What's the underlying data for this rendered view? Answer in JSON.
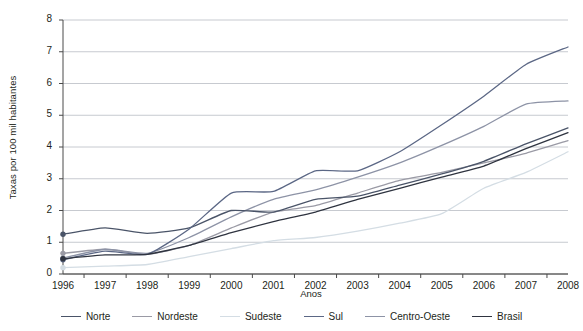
{
  "chart_data": {
    "type": "line",
    "title": "",
    "xlabel": "Anos",
    "ylabel": "Taxas por 100 mil habitantes",
    "x": [
      1996,
      1997,
      1998,
      1999,
      2000,
      2001,
      2002,
      2003,
      2004,
      2005,
      2006,
      2007,
      2008
    ],
    "xtick_labels": [
      "1996",
      "1997",
      "1998",
      "1999",
      "2000",
      "2001",
      "2002",
      "2003",
      "2004",
      "2005",
      "2006",
      "2007",
      "2008"
    ],
    "ytick_labels": [
      "0",
      "1",
      "2",
      "3",
      "4",
      "5",
      "6",
      "7",
      "8"
    ],
    "ylim": [
      0,
      8
    ],
    "xlim": [
      1996,
      2008
    ],
    "grid": true,
    "legend_position": "bottom",
    "markers_at_first_point": true,
    "series": [
      {
        "name": "Norte",
        "color": "#4a5468",
        "values": [
          1.25,
          1.45,
          1.28,
          1.45,
          2.0,
          1.95,
          2.35,
          2.45,
          2.8,
          3.15,
          3.55,
          4.1,
          4.6
        ]
      },
      {
        "name": "Nordeste",
        "color": "#9a9aa5",
        "values": [
          0.65,
          0.78,
          0.62,
          0.9,
          1.45,
          1.95,
          2.15,
          2.55,
          2.95,
          3.2,
          3.5,
          3.8,
          4.2
        ]
      },
      {
        "name": "Sudeste",
        "color": "#d4dde4",
        "values": [
          0.2,
          0.25,
          0.3,
          0.55,
          0.8,
          1.05,
          1.15,
          1.35,
          1.6,
          1.9,
          2.7,
          3.2,
          3.85
        ]
      },
      {
        "name": "Sul",
        "color": "#5b6785",
        "values": [
          0.45,
          0.72,
          0.62,
          1.42,
          2.55,
          2.6,
          3.25,
          3.25,
          3.85,
          4.7,
          5.6,
          6.6,
          7.15
        ]
      },
      {
        "name": "Centro-Oeste",
        "color": "#8d93a6",
        "values": [
          0.5,
          0.78,
          0.65,
          1.15,
          1.8,
          2.35,
          2.65,
          3.05,
          3.5,
          4.05,
          4.65,
          5.35,
          5.45
        ]
      },
      {
        "name": "Brasil",
        "color": "#2f3440",
        "values": [
          0.48,
          0.6,
          0.62,
          0.9,
          1.3,
          1.65,
          1.95,
          2.35,
          2.7,
          3.05,
          3.4,
          3.95,
          4.45
        ]
      }
    ]
  }
}
